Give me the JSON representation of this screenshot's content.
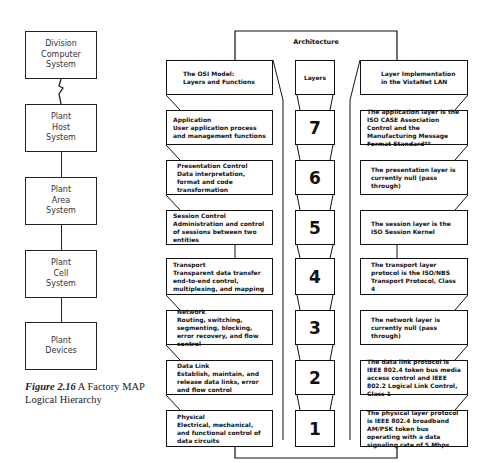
{
  "hierarchy": {
    "boxes": [
      {
        "label": "Division\nComputer\nSystem"
      },
      {
        "label": "Plant\nHost\nSystem"
      },
      {
        "label": "Plant\nArea\nSystem"
      },
      {
        "label": "Plant\nCell\nSystem"
      },
      {
        "label": "Plant\nDevices"
      }
    ],
    "link_icon": "lightning-bolt-icon"
  },
  "caption": {
    "figure": "Figure 2.16",
    "text": "A Factory MAP Logical Hierarchy"
  },
  "architecture": {
    "title": "Architecture",
    "headers": {
      "left": "The OSI Model:\nLayers and Functions",
      "middle": "Layers",
      "right": "Layer Implementation\nin the VistaNet LAN"
    },
    "layers": [
      {
        "number": "7",
        "name": "Application",
        "function": "User application process and management functions",
        "implementation": "The application layer is the ISO CASE Association Control and the Manufacturing Message Format Standard**"
      },
      {
        "number": "6",
        "name": "Presentation Control",
        "function": "Data interpretation, format and code transformation",
        "implementation": "The presentation layer is currently null (pass through)"
      },
      {
        "number": "5",
        "name": "Session Control",
        "function": "Administration and control of sessions between two entities",
        "implementation": "The session layer is the ISO Session Kernel"
      },
      {
        "number": "4",
        "name": "Transport",
        "function": "Transparent data transfer end-to-end control, multiplexing, and mapping",
        "implementation": "The transport layer protocol is the ISO/NBS Transport Protocol, Class 4"
      },
      {
        "number": "3",
        "name": "Network",
        "function": "Routing, switching, segmenting, blocking, error recovery, and flow control",
        "implementation": "The network layer is currently null (pass through)"
      },
      {
        "number": "2",
        "name": "Data Link",
        "function": "Establish, maintain, and release data links, error and flow control",
        "implementation": "The data link protocol is IEEE 802.4 token bus media access control and IEEE 802.2 Logical Link Control, Class 1"
      },
      {
        "number": "1",
        "name": "Physical",
        "function": "Electrical, mechanical, and functional control of data circuits",
        "implementation": "The physical layer protocol is IEEE 802.4 broadband AM/PSK token bus operating with a data signaling rate of 5 Mbps"
      }
    ]
  }
}
